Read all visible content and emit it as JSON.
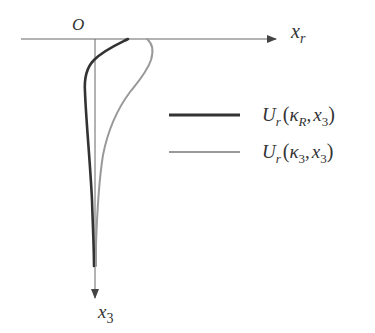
{
  "diagram": {
    "axes": {
      "origin_label": "O",
      "horizontal_label": "x",
      "horizontal_sub": "r",
      "vertical_label": "x",
      "vertical_sub": "3",
      "axis_color": "#555555"
    },
    "curves": [
      {
        "name": "U_r(kappa_R, x_3)",
        "color": "#333333",
        "width": 2.6,
        "path": "M128,39 C118,44 104,50 94,60 C86,68 84,78 85,92 C86,120 90,160 92,200 C93,230 94,250 94,266"
      },
      {
        "name": "U_r(kappa_3, x_3)",
        "color": "#999999",
        "width": 2.0,
        "path": "M147,39 C152,43 154,50 151,60 C147,72 138,82 130,92 C118,108 108,130 103,155 C99,180 97,215 96,245 C96,255 96,262 96,266"
      }
    ],
    "legend": [
      {
        "line_color": "#333333",
        "line_width": 3,
        "label_main": "U",
        "label_sub": "r",
        "label_open": "(",
        "label_kappa": "κ",
        "label_kappa_sub": "R",
        "label_sep": ",",
        "label_x": "x",
        "label_x_sub": "3",
        "label_close": ")"
      },
      {
        "line_color": "#999999",
        "line_width": 2.2,
        "label_main": "U",
        "label_sub": "r",
        "label_open": "(",
        "label_kappa": "κ",
        "label_kappa_sub": "3",
        "label_sep": ",",
        "label_x": "x",
        "label_x_sub": "3",
        "label_close": ")"
      }
    ]
  }
}
